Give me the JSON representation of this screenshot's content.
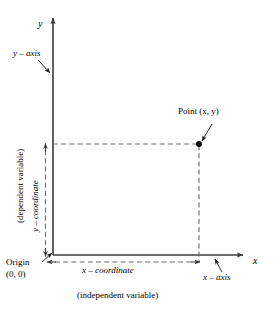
{
  "diagram": {
    "colors": {
      "axis": "#3a3a3a",
      "dashed": "#666666",
      "text": "#000000",
      "point": "#000000",
      "background": "#ffffff"
    },
    "axes": {
      "y_tip_label": "y",
      "x_tip_label": "x",
      "origin_x": 53,
      "origin_y": 255,
      "x_end": 248,
      "y_end": 13
    },
    "labels": {
      "y_axis": "y – axis",
      "x_axis": "x – axis",
      "y_coordinate": "y – coordinate",
      "x_coordinate": "x – coordinate",
      "dependent_variable": "(dependent variable)",
      "independent_variable": "(independent variable)",
      "origin_name": "Origin",
      "origin_value": "(0, 0)",
      "point": "Point (x, y)"
    },
    "point": {
      "label": "Point (x, y)",
      "px": 199,
      "py": 144,
      "x_value": "x",
      "y_value": "y"
    },
    "guides": {
      "horizontal_from_axis": true,
      "vertical_to_axis": true,
      "y_measure_arrows": "double",
      "x_measure_arrows": "double"
    }
  }
}
